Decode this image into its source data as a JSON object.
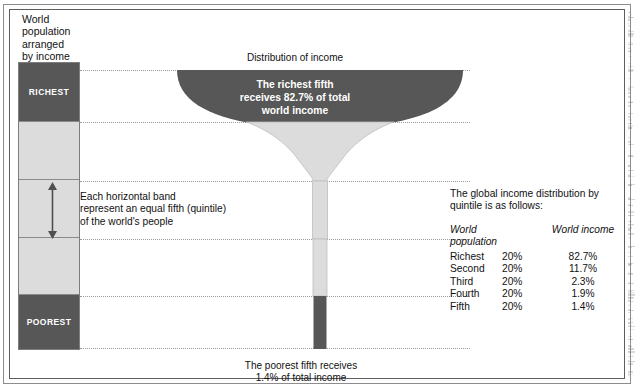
{
  "header": {
    "title_lines": [
      "World",
      "population",
      "arranged",
      "by income"
    ],
    "title_text": "World population arranged by income"
  },
  "column": {
    "name": "world-population-quintiles",
    "top_label": "RICHEST",
    "bottom_label": "POOREST",
    "bands": [
      {
        "label": "RICHEST",
        "shade": "dark"
      },
      {
        "label": "",
        "shade": "light"
      },
      {
        "label": "",
        "shade": "light"
      },
      {
        "label": "",
        "shade": "light"
      },
      {
        "label": "POOREST",
        "shade": "dark"
      }
    ]
  },
  "annotations": {
    "distribution_caption": "Distribution of income",
    "bowl_text_lines": [
      "The richest fifth",
      "receives 82.7% of total",
      "world income"
    ],
    "bowl_text": "The richest fifth receives 82.7% of total world income",
    "band_note_lines": [
      "Each horizontal band",
      "represent an equal fifth (quintile)",
      "of the world's people"
    ],
    "band_note": "Each horizontal band represent an equal fifth (quintile) of the world's people",
    "bottom_caption_lines": [
      "The poorest fifth receives",
      "1.4% of total income"
    ],
    "bottom_caption": "The poorest fifth receives 1.4% of total income"
  },
  "info_panel": {
    "lead_lines": [
      "The global income distribution by",
      "quintile is as follows:"
    ],
    "lead": "The global income distribution by quintile is as follows:",
    "headers": [
      "World population",
      "World income"
    ],
    "rows": [
      {
        "group": "Richest",
        "share": "20%",
        "income": "82.7%"
      },
      {
        "group": "Second",
        "share": "20%",
        "income": "11.7%"
      },
      {
        "group": "Third",
        "share": "20%",
        "income": "2.3%"
      },
      {
        "group": "Fourth",
        "share": "20%",
        "income": "1.9%"
      },
      {
        "group": "Fifth",
        "share": "20%",
        "income": "1.4%"
      }
    ]
  },
  "chart_data": {
    "type": "bar",
    "title": "Distribution of income",
    "subtitle": "World population arranged by income",
    "xlabel": "",
    "ylabel": "World income share (%)",
    "categories": [
      "Richest 20%",
      "Second 20%",
      "Third 20%",
      "Fourth 20%",
      "Fifth 20%"
    ],
    "values": [
      82.7,
      11.7,
      2.3,
      1.9,
      1.4
    ],
    "population_shares": [
      20,
      20,
      20,
      20,
      20
    ],
    "units": "percent",
    "ylim": [
      0,
      100
    ],
    "grid": false,
    "legend": "none"
  },
  "colors": {
    "dark_gray": "#575757",
    "light_gray": "#dcdcdc",
    "mid_gray": "#9a9a9a",
    "frame": "#5e5e5e",
    "text": "#111111",
    "bowl_text": "#ffffff"
  }
}
